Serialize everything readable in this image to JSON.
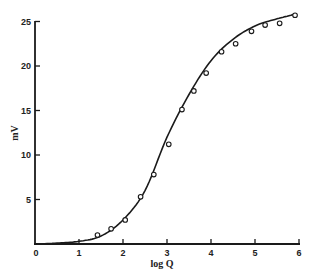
{
  "chart_data": {
    "type": "scatter",
    "title": "",
    "xlabel": "log Q",
    "ylabel": "mV",
    "xlim": [
      0,
      6
    ],
    "ylim": [
      0,
      25
    ],
    "grid": false,
    "legend": null,
    "x_ticks": [
      "0",
      "1",
      "2",
      "3",
      "4",
      "5",
      "6"
    ],
    "y_ticks": [
      "5",
      "10",
      "15",
      "20",
      "25"
    ],
    "series": [
      {
        "name": "observed",
        "style": "open-circle markers",
        "x": [
          1.42,
          1.73,
          2.05,
          2.4,
          2.7,
          3.04,
          3.34,
          3.61,
          3.89,
          4.24,
          4.56,
          4.92,
          5.23,
          5.56,
          5.91
        ],
        "y": [
          1.0,
          1.7,
          2.7,
          5.3,
          7.8,
          11.2,
          15.1,
          17.2,
          19.2,
          21.6,
          22.5,
          23.9,
          24.6,
          24.8,
          25.7
        ]
      },
      {
        "name": "fitted curve",
        "style": "solid line",
        "x": [
          0,
          0.5,
          1.0,
          1.5,
          2.0,
          2.5,
          3.0,
          3.5,
          4.0,
          4.5,
          5.0,
          5.5,
          5.9
        ],
        "y": [
          0,
          0.1,
          0.3,
          0.9,
          2.7,
          6.0,
          12.0,
          16.8,
          20.6,
          23.0,
          24.5,
          25.3,
          25.8
        ]
      }
    ]
  }
}
